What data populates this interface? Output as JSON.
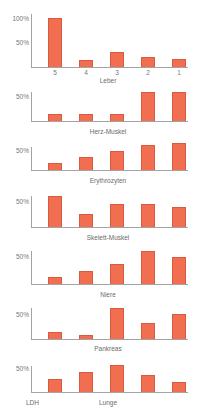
{
  "figure": {
    "footer_label": "LDH",
    "bar_color": "#f26e50",
    "bar_border_color": "#d95a3e",
    "axis_color": "#a3a3a3",
    "text_color": "#6b6b6b"
  },
  "chart_data": [
    {
      "type": "bar",
      "title": "Leber",
      "xlabel": "Leber",
      "ylabel": "",
      "categories": [
        "5",
        "4",
        "3",
        "2",
        "1"
      ],
      "values": [
        98,
        14,
        29,
        20,
        16
      ],
      "yticks": [
        "100%",
        "50%"
      ],
      "ylim": [
        0,
        100
      ],
      "grid": false,
      "unit": "%"
    },
    {
      "type": "bar",
      "title": "Herz-Muskel",
      "xlabel": "Herz-Muskel",
      "categories": [
        "5",
        "4",
        "3",
        "2",
        "1"
      ],
      "values": [
        13,
        13,
        13,
        58,
        58
      ],
      "yticks": [
        "50%"
      ],
      "ylim": [
        0,
        60
      ],
      "grid": false,
      "unit": "%"
    },
    {
      "type": "bar",
      "title": "Erythrozyten",
      "xlabel": "Erythrozyten",
      "categories": [
        "5",
        "4",
        "3",
        "2",
        "1"
      ],
      "values": [
        17,
        32,
        47,
        62,
        68
      ],
      "yticks": [
        "50%"
      ],
      "ylim": [
        0,
        60
      ],
      "grid": false,
      "unit": "%"
    },
    {
      "type": "bar",
      "title": "Skelett-Muskel",
      "xlabel": "Skelett-Muskel",
      "categories": [
        "5",
        "4",
        "3",
        "2",
        "1"
      ],
      "values": [
        60,
        25,
        44,
        44,
        38
      ],
      "yticks": [
        "50%"
      ],
      "ylim": [
        0,
        60
      ],
      "grid": false,
      "unit": "%"
    },
    {
      "type": "bar",
      "title": "Niere",
      "xlabel": "Niere",
      "categories": [
        "5",
        "4",
        "3",
        "2",
        "1"
      ],
      "values": [
        12,
        23,
        36,
        59,
        48
      ],
      "yticks": [
        "50%"
      ],
      "ylim": [
        0,
        60
      ],
      "grid": false,
      "unit": "%"
    },
    {
      "type": "bar",
      "title": "Pankreas",
      "xlabel": "Pankreas",
      "categories": [
        "5",
        "4",
        "3",
        "2",
        "1"
      ],
      "values": [
        14,
        8,
        62,
        32,
        50
      ],
      "yticks": [
        "50%"
      ],
      "ylim": [
        0,
        60
      ],
      "grid": false,
      "unit": "%"
    },
    {
      "type": "bar",
      "title": "Lunge",
      "xlabel": "Lunge",
      "categories": [
        "5",
        "4",
        "3",
        "2",
        "1"
      ],
      "values": [
        27,
        42,
        56,
        35,
        21
      ],
      "yticks": [
        "50%"
      ],
      "ylim": [
        0,
        60
      ],
      "grid": false,
      "unit": "%"
    }
  ]
}
